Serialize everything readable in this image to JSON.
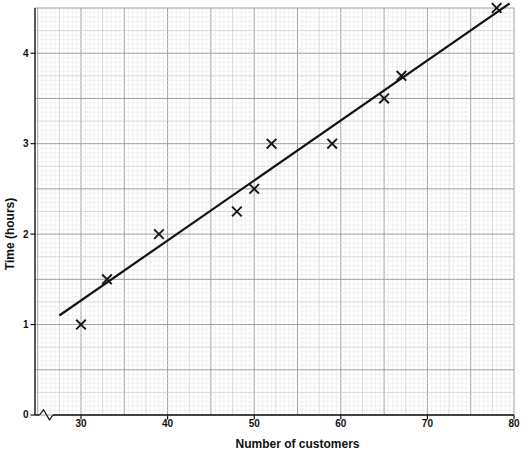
{
  "chart_data": {
    "type": "scatter",
    "title": "",
    "xlabel": "Number of customers",
    "ylabel": "Time (hours)",
    "x_ticks": [
      30,
      40,
      50,
      60,
      70,
      80
    ],
    "y_ticks": [
      0,
      1,
      2,
      3,
      4
    ],
    "xlim": [
      30,
      80
    ],
    "ylim": [
      0,
      4.5
    ],
    "x_axis_break": true,
    "grid": "graph-paper: minor 0.5 customers x 0.05 hours, medium every 5 minor cells, major every 5 customers / 0.5 hours",
    "legend": "none",
    "marker": "x",
    "points": [
      {
        "x": 30,
        "y": 1.0
      },
      {
        "x": 33,
        "y": 1.5
      },
      {
        "x": 39,
        "y": 2.0
      },
      {
        "x": 48,
        "y": 2.25
      },
      {
        "x": 50,
        "y": 2.5
      },
      {
        "x": 52,
        "y": 3.0
      },
      {
        "x": 59,
        "y": 3.0
      },
      {
        "x": 65,
        "y": 3.5
      },
      {
        "x": 67,
        "y": 3.75
      },
      {
        "x": 78,
        "y": 4.5
      }
    ],
    "best_fit_line": {
      "x1": 27.5,
      "y1": 1.1,
      "x2": 79.5,
      "y2": 4.55
    },
    "colors": {
      "marker": "#161616",
      "best_fit_line": "#131313",
      "axis": "#141414",
      "grid_minor": "#e5e5e5",
      "grid_medium": "#cccccc",
      "grid_major": "#9f9f9f",
      "background": "#ffffff"
    }
  }
}
